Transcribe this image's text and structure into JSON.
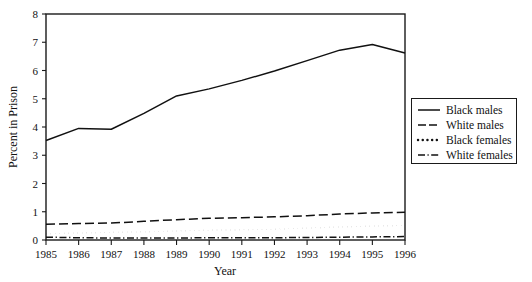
{
  "chart_data": {
    "type": "line",
    "title": "",
    "xlabel": "Year",
    "ylabel": "Percent in Prison",
    "categories": [
      1985,
      1986,
      1987,
      1988,
      1989,
      1990,
      1991,
      1992,
      1993,
      1994,
      1995,
      1996
    ],
    "x_tick_labels": [
      "1985",
      "1986",
      "1987",
      "1988",
      "1989",
      "1990",
      "1991",
      "1992",
      "1993",
      "1994",
      "1995",
      "1996"
    ],
    "y_tick_labels": [
      "0",
      "1",
      "2",
      "3",
      "4",
      "5",
      "6",
      "7",
      "8"
    ],
    "y_ticks": [
      0,
      1,
      2,
      3,
      4,
      5,
      6,
      7,
      8
    ],
    "xlim": [
      1985,
      1996
    ],
    "ylim": [
      0,
      8
    ],
    "grid": false,
    "legend_position": "right",
    "series": [
      {
        "name": "Black males",
        "line_style": "solid",
        "color": "#111111",
        "values": [
          3.52,
          3.95,
          3.92,
          4.48,
          5.1,
          5.35,
          5.65,
          5.98,
          6.35,
          6.72,
          6.92,
          6.62
        ]
      },
      {
        "name": "White males",
        "line_style": "dashed",
        "color": "#111111",
        "values": [
          0.56,
          0.58,
          0.6,
          0.66,
          0.72,
          0.77,
          0.79,
          0.82,
          0.86,
          0.92,
          0.96,
          0.98
        ]
      },
      {
        "name": "Black females",
        "line_style": "dotted",
        "color": "#111111",
        "values": [
          0.22,
          0.25,
          0.27,
          0.29,
          0.32,
          0.35,
          0.36,
          0.38,
          0.42,
          0.46,
          0.49,
          0.52
        ]
      },
      {
        "name": "White females",
        "line_style": "dashdot",
        "color": "#111111",
        "values": [
          0.1,
          0.08,
          0.07,
          0.07,
          0.07,
          0.08,
          0.08,
          0.08,
          0.09,
          0.1,
          0.11,
          0.12
        ]
      }
    ]
  },
  "legend": {
    "entries": [
      {
        "label": "Black males",
        "style": "solid"
      },
      {
        "label": "White males",
        "style": "dashed"
      },
      {
        "label": "Black females",
        "style": "dotted"
      },
      {
        "label": "White females",
        "style": "dashdot"
      }
    ]
  },
  "axes": {
    "y_title": "Percent in Prison",
    "x_title": "Year"
  }
}
